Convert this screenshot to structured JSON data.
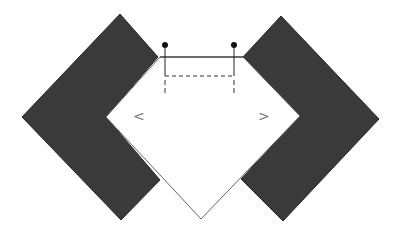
{
  "diagram": {
    "width": 398,
    "height": 235,
    "background": "#ffffff",
    "shape_fill": "#3a3a3a",
    "line_color": "#222222",
    "outline_color": "#666666",
    "left_chevron_symbol": "<",
    "right_chevron_symbol": ">",
    "left_shape": {
      "points": "120,14 22,117 121,220 160,180 106,117 158,57"
    },
    "right_shape": {
      "points": "281,16 379,119 283,221 241,179 300,116 243,57"
    },
    "center_shape": {
      "points": "160,57 243,57 300,116 201,219 106,117"
    },
    "pins": [
      {
        "x": 165,
        "y": 45
      },
      {
        "x": 234,
        "y": 45
      }
    ],
    "dashed_line_y": 76,
    "pin_line_bottom": 93
  }
}
